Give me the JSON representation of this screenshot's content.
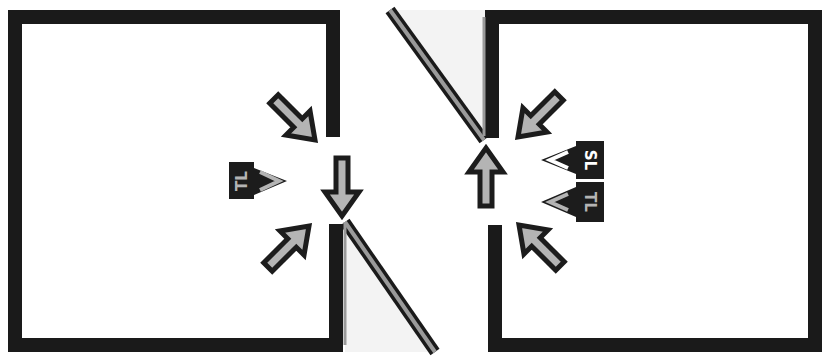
{
  "diagram": {
    "colors": {
      "wall": "#1a1a1a",
      "arrow_fill": "#b4b4b4",
      "arrow_stroke": "#1c1c1c",
      "hatch_fill": "#f3f3f3",
      "background": "#ffffff"
    },
    "left_room": {
      "labels": [
        {
          "id": "left-tl-label",
          "text": "TL"
        }
      ],
      "arrows": [
        {
          "id": "upper-diag",
          "direction": "down-right"
        },
        {
          "id": "tl-right",
          "direction": "right",
          "label": "TL"
        },
        {
          "id": "lower-diag",
          "direction": "up-right"
        },
        {
          "id": "gap-down",
          "direction": "down"
        }
      ]
    },
    "right_room": {
      "labels": [
        {
          "id": "right-sl-label",
          "text": "SL"
        },
        {
          "id": "right-tl-label",
          "text": "TL"
        }
      ],
      "arrows": [
        {
          "id": "upper-diag",
          "direction": "down-left"
        },
        {
          "id": "sl-left",
          "direction": "left",
          "label": "SL"
        },
        {
          "id": "tl-left",
          "direction": "left",
          "label": "TL"
        },
        {
          "id": "lower-diag",
          "direction": "up-left"
        },
        {
          "id": "gap-up",
          "direction": "up"
        }
      ]
    }
  }
}
